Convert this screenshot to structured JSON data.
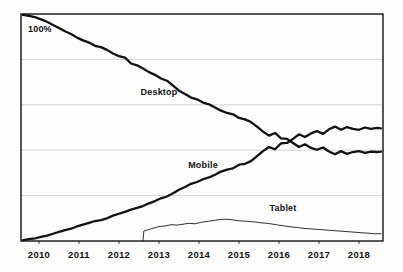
{
  "chart_data": {
    "type": "line",
    "title": "",
    "subtitle": "",
    "xlabel": "",
    "ylabel": "",
    "xlim": [
      2009.55,
      2018.6
    ],
    "ylim": [
      0,
      100
    ],
    "grid": true,
    "gridlines_y": [
      20,
      40,
      60,
      80
    ],
    "legend_position": "inline-annotations",
    "y_corner_label": "100%",
    "x_tick_labels": [
      "2010",
      "2011",
      "2012",
      "2013",
      "2014",
      "2015",
      "2016",
      "2017",
      "2018"
    ],
    "x_ticks": [
      2010,
      2011,
      2012,
      2013,
      2014,
      2015,
      2016,
      2017,
      2018
    ],
    "annotations": [
      {
        "text": "Desktop",
        "x": 2013.0,
        "y": 65
      },
      {
        "text": "Mobile",
        "x": 2014.1,
        "y": 33
      },
      {
        "text": "Tablet",
        "x": 2016.1,
        "y": 14
      }
    ],
    "series": [
      {
        "name": "Desktop",
        "color": "#111111",
        "width": 2.3,
        "x": [
          2009.6,
          2009.75,
          2009.9,
          2010.05,
          2010.2,
          2010.35,
          2010.5,
          2010.65,
          2010.8,
          2010.95,
          2011.1,
          2011.25,
          2011.4,
          2011.55,
          2011.7,
          2011.85,
          2012.0,
          2012.15,
          2012.3,
          2012.45,
          2012.6,
          2012.75,
          2012.9,
          2013.05,
          2013.2,
          2013.35,
          2013.5,
          2013.65,
          2013.8,
          2013.95,
          2014.1,
          2014.25,
          2014.4,
          2014.55,
          2014.7,
          2014.85,
          2015.0,
          2015.15,
          2015.3,
          2015.45,
          2015.6,
          2015.75,
          2015.9,
          2016.05,
          2016.2,
          2016.35,
          2016.5,
          2016.65,
          2016.8,
          2016.95,
          2017.1,
          2017.25,
          2017.4,
          2017.55,
          2017.7,
          2017.85,
          2018.0,
          2018.15,
          2018.3,
          2018.45,
          2018.55
        ],
        "y": [
          99.6,
          99.2,
          98.6,
          97.6,
          96.6,
          95.2,
          93.8,
          92.4,
          91.2,
          89.6,
          88.4,
          87.4,
          86.0,
          85.4,
          84.2,
          82.6,
          81.4,
          80.8,
          78.2,
          77.4,
          76.0,
          74.4,
          73.2,
          71.6,
          70.6,
          68.4,
          66.2,
          64.8,
          63.2,
          62.4,
          61.0,
          60.2,
          58.8,
          57.4,
          56.4,
          55.8,
          54.2,
          53.6,
          52.4,
          50.4,
          48.2,
          46.4,
          47.6,
          45.2,
          45.0,
          43.2,
          41.4,
          42.6,
          41.0,
          40.2,
          41.2,
          39.4,
          38.2,
          39.6,
          38.4,
          39.2,
          39.6,
          38.8,
          39.4,
          39.2,
          39.4
        ]
      },
      {
        "name": "Mobile",
        "color": "#111111",
        "width": 2.3,
        "x": [
          2009.6,
          2009.75,
          2009.9,
          2010.05,
          2010.2,
          2010.35,
          2010.5,
          2010.65,
          2010.8,
          2010.95,
          2011.1,
          2011.25,
          2011.4,
          2011.55,
          2011.7,
          2011.85,
          2012.0,
          2012.15,
          2012.3,
          2012.45,
          2012.6,
          2012.75,
          2012.9,
          2013.05,
          2013.2,
          2013.35,
          2013.5,
          2013.65,
          2013.8,
          2013.95,
          2014.1,
          2014.25,
          2014.4,
          2014.55,
          2014.7,
          2014.85,
          2015.0,
          2015.15,
          2015.3,
          2015.45,
          2015.6,
          2015.75,
          2015.9,
          2016.05,
          2016.2,
          2016.35,
          2016.5,
          2016.65,
          2016.8,
          2016.95,
          2017.1,
          2017.25,
          2017.4,
          2017.55,
          2017.7,
          2017.85,
          2018.0,
          2018.15,
          2018.3,
          2018.45,
          2018.55
        ],
        "y": [
          0.4,
          0.8,
          1.2,
          1.8,
          2.4,
          3.2,
          4.0,
          4.8,
          5.4,
          6.4,
          7.2,
          8.0,
          8.8,
          9.2,
          10.0,
          11.2,
          12.0,
          12.8,
          13.8,
          14.6,
          15.4,
          16.6,
          17.6,
          18.8,
          19.6,
          21.0,
          22.6,
          23.8,
          25.2,
          26.0,
          27.2,
          28.0,
          29.2,
          30.6,
          31.4,
          32.0,
          33.6,
          34.0,
          35.2,
          37.4,
          39.6,
          41.4,
          40.4,
          43.0,
          43.2,
          45.0,
          47.0,
          45.8,
          47.4,
          48.4,
          47.2,
          49.2,
          50.4,
          49.0,
          50.2,
          49.4,
          49.0,
          50.0,
          49.4,
          49.8,
          49.6
        ]
      },
      {
        "name": "Tablet",
        "color": "#333333",
        "width": 1.0,
        "x": [
          2012.6,
          2012.62,
          2012.7,
          2012.85,
          2013.0,
          2013.15,
          2013.3,
          2013.45,
          2013.6,
          2013.75,
          2013.9,
          2014.05,
          2014.2,
          2014.35,
          2014.5,
          2014.65,
          2014.8,
          2014.95,
          2015.1,
          2015.25,
          2015.4,
          2015.55,
          2015.7,
          2015.85,
          2016.0,
          2016.15,
          2016.3,
          2016.45,
          2016.6,
          2016.75,
          2016.9,
          2017.05,
          2017.2,
          2017.35,
          2017.5,
          2017.65,
          2017.8,
          2017.95,
          2018.1,
          2018.25,
          2018.4,
          2018.55
        ],
        "y": [
          0.0,
          4.4,
          4.8,
          5.6,
          6.4,
          6.6,
          7.2,
          7.0,
          7.4,
          7.8,
          7.6,
          8.2,
          8.6,
          9.0,
          9.4,
          9.6,
          9.4,
          9.0,
          8.8,
          8.6,
          8.4,
          8.0,
          7.8,
          7.4,
          7.0,
          6.6,
          6.2,
          6.0,
          5.6,
          5.4,
          5.2,
          5.0,
          4.8,
          4.6,
          4.4,
          4.2,
          4.0,
          3.8,
          3.6,
          3.4,
          3.2,
          3.2
        ]
      }
    ]
  },
  "layout": {
    "plot_left": 21,
    "plot_right": 383,
    "plot_top": 14,
    "plot_bottom": 241,
    "background": "#fdfdfd",
    "border_color": "#111111",
    "grid_color": "#cfcfcf"
  }
}
